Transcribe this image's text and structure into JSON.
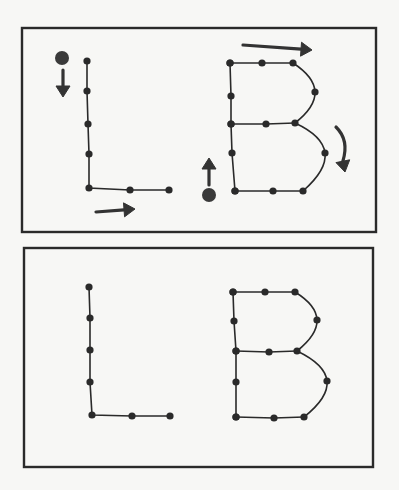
{
  "figure": {
    "letters": [
      "L",
      "B"
    ],
    "colors": {
      "ink": "#2a2a2a",
      "paper": "#f7f7f5",
      "arrow": "#333333"
    }
  },
  "panels": [
    {
      "id": "with-direction-arrows",
      "frame": {
        "x": 22,
        "y": 28,
        "w": 354,
        "h": 204
      },
      "letter_L": {
        "points": [
          [
            87,
            61
          ],
          [
            87,
            91
          ],
          [
            88,
            124
          ],
          [
            89,
            154
          ],
          [
            89,
            188
          ],
          [
            130,
            190
          ],
          [
            169,
            190
          ]
        ],
        "start_marker": {
          "x": 62,
          "y": 58,
          "r": 7
        },
        "arrows": [
          {
            "name": "down-arrow",
            "from": [
              63,
              70
            ],
            "to": [
              63,
              97
            ]
          },
          {
            "name": "right-arrow",
            "from": [
              96,
              212
            ],
            "to": [
              135,
              209
            ]
          }
        ]
      },
      "letter_B": {
        "spine": [
          [
            230,
            63
          ],
          [
            231,
            96
          ],
          [
            231,
            124
          ],
          [
            232,
            153
          ],
          [
            235,
            191
          ]
        ],
        "top_bar": [
          [
            230,
            63
          ],
          [
            262,
            63
          ],
          [
            293,
            63
          ]
        ],
        "upper_bowl": {
          "from": [
            293,
            63
          ],
          "via": [
            315,
            92
          ],
          "to": [
            295,
            123
          ]
        },
        "middle_bar": [
          [
            231,
            124
          ],
          [
            266,
            124
          ],
          [
            295,
            123
          ]
        ],
        "lower_bowl": {
          "from": [
            295,
            123
          ],
          "via": [
            325,
            153
          ],
          "to": [
            303,
            191
          ]
        },
        "bottom_bar": [
          [
            235,
            191
          ],
          [
            273,
            191
          ],
          [
            303,
            191
          ]
        ],
        "start_marker": {
          "x": 209,
          "y": 195,
          "r": 7
        },
        "arrows": [
          {
            "name": "up-arrow",
            "from": [
              209,
              185
            ],
            "to": [
              209,
              158
            ]
          },
          {
            "name": "top-right-arrow",
            "from": [
              243,
              45
            ],
            "to": [
              312,
              50
            ]
          },
          {
            "name": "curved-down-arrow",
            "from": [
              336,
              127
            ],
            "to": [
              345,
              172
            ]
          }
        ]
      }
    },
    {
      "id": "completed-outline",
      "frame": {
        "x": 24,
        "y": 248,
        "w": 349,
        "h": 219
      },
      "letter_L": {
        "points": [
          [
            89,
            287
          ],
          [
            90,
            318
          ],
          [
            90,
            350
          ],
          [
            90,
            382
          ],
          [
            92,
            415
          ],
          [
            132,
            416
          ],
          [
            170,
            416
          ]
        ]
      },
      "letter_B": {
        "spine": [
          [
            233,
            292
          ],
          [
            234,
            321
          ],
          [
            236,
            351
          ],
          [
            236,
            382
          ],
          [
            236,
            417
          ]
        ],
        "top_bar": [
          [
            233,
            292
          ],
          [
            265,
            292
          ],
          [
            295,
            292
          ]
        ],
        "upper_bowl": {
          "from": [
            295,
            292
          ],
          "via": [
            317,
            320
          ],
          "to": [
            297,
            351
          ]
        },
        "middle_bar": [
          [
            236,
            351
          ],
          [
            269,
            352
          ],
          [
            297,
            351
          ]
        ],
        "lower_bowl": {
          "from": [
            297,
            351
          ],
          "via": [
            327,
            381
          ],
          "to": [
            304,
            417
          ]
        },
        "bottom_bar": [
          [
            236,
            417
          ],
          [
            274,
            418
          ],
          [
            304,
            417
          ]
        ]
      }
    }
  ]
}
